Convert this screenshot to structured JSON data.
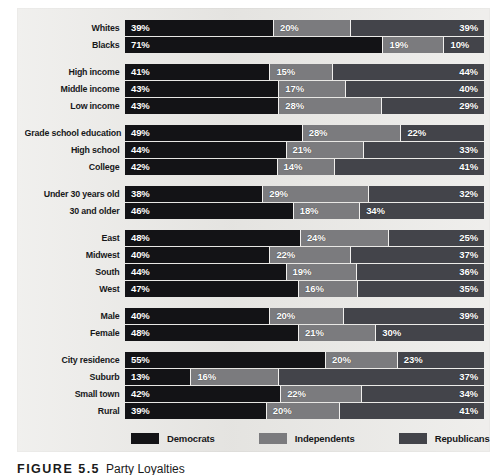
{
  "figure": {
    "caption_number": "FIGURE 5.5",
    "caption_text": "Party Loyalties"
  },
  "legend": {
    "items": [
      {
        "label": "Democrats",
        "color": "#131316",
        "key": "democrats"
      },
      {
        "label": "Independents",
        "color": "#7b7b7e",
        "key": "independents"
      },
      {
        "label": "Republicans",
        "color": "#43444a",
        "key": "republicans"
      }
    ]
  },
  "colors": {
    "panel_background": "#e9e8e5",
    "democrats": "#131316",
    "independents": "#7b7b7e",
    "republicans": "#43444a",
    "segment_divider": "#f1f0ee",
    "value_text": "#ffffff",
    "label_text": "#17181a"
  },
  "chart_data": {
    "type": "bar",
    "orientation": "horizontal",
    "stacked": true,
    "title": "",
    "subtitle": "",
    "xlabel": "",
    "ylabel": "",
    "xlim": [
      0,
      100
    ],
    "grid": false,
    "legend_position": "bottom",
    "series": [
      {
        "name": "Democrats",
        "color": "#131316"
      },
      {
        "name": "Independents",
        "color": "#7b7b7e"
      },
      {
        "name": "Republicans",
        "color": "#43444a"
      }
    ],
    "groups": [
      {
        "name": "race",
        "rows": [
          {
            "category": "Whites",
            "democrats": 39,
            "independents": 20,
            "republicans": 39,
            "labels": [
              "39%",
              "20%",
              "39%"
            ],
            "widths": [
              41.5,
              21.5,
              37.0
            ],
            "value_align": [
              "left",
              "left",
              "right"
            ]
          },
          {
            "category": "Blacks",
            "democrats": 71,
            "independents": 19,
            "republicans": 10,
            "labels": [
              "71%",
              "19%",
              "10%"
            ],
            "widths": [
              72.0,
              17.0,
              11.0
            ],
            "value_align": [
              "left",
              "left",
              "left"
            ]
          }
        ]
      },
      {
        "name": "income",
        "rows": [
          {
            "category": "High income",
            "democrats": 41,
            "independents": 15,
            "republicans": 44,
            "labels": [
              "41%",
              "15%",
              "44%"
            ],
            "widths": [
              40.5,
              17.5,
              42.0
            ],
            "value_align": [
              "left",
              "left",
              "right"
            ]
          },
          {
            "category": "Middle income",
            "democrats": 43,
            "independents": 17,
            "republicans": 40,
            "labels": [
              "43%",
              "17%",
              "40%"
            ],
            "widths": [
              43.0,
              18.5,
              38.5
            ],
            "value_align": [
              "left",
              "left",
              "right"
            ]
          },
          {
            "category": "Low income",
            "democrats": 43,
            "independents": 28,
            "republicans": 29,
            "labels": [
              "43%",
              "28%",
              "29%"
            ],
            "widths": [
              43.0,
              28.5,
              28.5
            ],
            "value_align": [
              "left",
              "left",
              "right"
            ]
          }
        ]
      },
      {
        "name": "education",
        "rows": [
          {
            "category": "Grade school education",
            "democrats": 49,
            "independents": 28,
            "republicans": 22,
            "labels": [
              "49%",
              "28%",
              "22%"
            ],
            "widths": [
              49.5,
              27.5,
              23.0
            ],
            "value_align": [
              "left",
              "left",
              "left"
            ]
          },
          {
            "category": "High school",
            "democrats": 44,
            "independents": 21,
            "republicans": 33,
            "labels": [
              "44%",
              "21%",
              "33%"
            ],
            "widths": [
              45.0,
              21.5,
              33.5
            ],
            "value_align": [
              "left",
              "left",
              "right"
            ]
          },
          {
            "category": "College",
            "democrats": 42,
            "independents": 14,
            "republicans": 41,
            "labels": [
              "42%",
              "14%",
              "41%"
            ],
            "widths": [
              42.5,
              16.0,
              41.5
            ],
            "value_align": [
              "left",
              "left",
              "right"
            ]
          }
        ]
      },
      {
        "name": "age",
        "rows": [
          {
            "category": "Under 30 years old",
            "democrats": 38,
            "independents": 29,
            "republicans": 32,
            "labels": [
              "38%",
              "29%",
              "32%"
            ],
            "widths": [
              38.5,
              29.5,
              32.0
            ],
            "value_align": [
              "left",
              "left",
              "right"
            ]
          },
          {
            "category": "30 and older",
            "democrats": 46,
            "independents": 18,
            "republicans": 34,
            "labels": [
              "46%",
              "18%",
              "34%"
            ],
            "widths": [
              47.0,
              18.5,
              34.5
            ],
            "value_align": [
              "left",
              "left",
              "left"
            ]
          }
        ]
      },
      {
        "name": "region",
        "rows": [
          {
            "category": "East",
            "democrats": 48,
            "independents": 24,
            "republicans": 25,
            "labels": [
              "48%",
              "24%",
              "25%"
            ],
            "widths": [
              49.0,
              24.5,
              26.5
            ],
            "value_align": [
              "left",
              "left",
              "right"
            ]
          },
          {
            "category": "Midwest",
            "democrats": 40,
            "independents": 22,
            "republicans": 37,
            "labels": [
              "40%",
              "22%",
              "37%"
            ],
            "widths": [
              40.5,
              22.5,
              37.0
            ],
            "value_align": [
              "left",
              "left",
              "right"
            ]
          },
          {
            "category": "South",
            "democrats": 44,
            "independents": 19,
            "republicans": 36,
            "labels": [
              "44%",
              "19%",
              "36%"
            ],
            "widths": [
              45.0,
              19.5,
              35.5
            ],
            "value_align": [
              "left",
              "left",
              "right"
            ]
          },
          {
            "category": "West",
            "democrats": 47,
            "independents": 16,
            "republicans": 35,
            "labels": [
              "47%",
              "16%",
              "35%"
            ],
            "widths": [
              48.5,
              16.5,
              35.0
            ],
            "value_align": [
              "left",
              "left",
              "right"
            ]
          }
        ]
      },
      {
        "name": "gender",
        "rows": [
          {
            "category": "Male",
            "democrats": 40,
            "independents": 20,
            "republicans": 39,
            "labels": [
              "40%",
              "20%",
              "39%"
            ],
            "widths": [
              40.5,
              20.5,
              39.0
            ],
            "value_align": [
              "left",
              "left",
              "right"
            ]
          },
          {
            "category": "Female",
            "democrats": 48,
            "independents": 21,
            "republicans": 30,
            "labels": [
              "48%",
              "21%",
              "30%"
            ],
            "widths": [
              48.5,
              21.5,
              30.0
            ],
            "value_align": [
              "left",
              "left",
              "left"
            ]
          }
        ]
      },
      {
        "name": "residence",
        "rows": [
          {
            "category": "City residence",
            "democrats": 55,
            "independents": 20,
            "republicans": 23,
            "labels": [
              "55%",
              "20%",
              "23%"
            ],
            "widths": [
              56.0,
              20.0,
              24.0
            ],
            "value_align": [
              "left",
              "left",
              "left"
            ]
          },
          {
            "category": "Suburb",
            "democrats": 13,
            "independents": 16,
            "republicans": 37,
            "labels": [
              "13%",
              "16%",
              "37%"
            ],
            "widths": [
              18.5,
              24.5,
              57.0
            ],
            "value_align": [
              "left",
              "left",
              "right"
            ]
          },
          {
            "category": "Small town",
            "democrats": 42,
            "independents": 22,
            "republicans": 34,
            "labels": [
              "42%",
              "22%",
              "34%"
            ],
            "widths": [
              43.5,
              22.5,
              34.0
            ],
            "value_align": [
              "left",
              "left",
              "right"
            ]
          },
          {
            "category": "Rural",
            "democrats": 39,
            "independents": 20,
            "republicans": 41,
            "labels": [
              "39%",
              "20%",
              "41%"
            ],
            "widths": [
              39.5,
              20.5,
              40.0
            ],
            "value_align": [
              "left",
              "left",
              "right"
            ]
          }
        ]
      }
    ]
  }
}
